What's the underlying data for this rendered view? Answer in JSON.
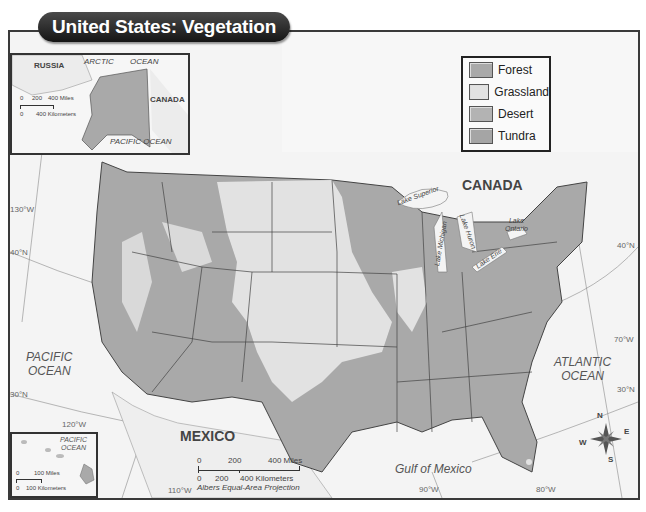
{
  "title": "United States: Vegetation",
  "legend": {
    "items": [
      {
        "label": "Forest",
        "color": "#a9a9a9"
      },
      {
        "label": "Grassland",
        "color": "#e2e2e2"
      },
      {
        "label": "Desert",
        "color": "#b3b3b3"
      },
      {
        "label": "Tundra",
        "color": "#a5a5a5"
      }
    ]
  },
  "colors": {
    "water": "#f4f4f4",
    "land_outside": "#f0f0f0",
    "forest": "#a9a9a9",
    "grassland": "#e2e2e2",
    "border": "#3a3a3a",
    "title_bg": "#1c1c1c"
  },
  "labels": {
    "countries": {
      "canada": "CANADA",
      "mexico": "MEXICO"
    },
    "oceans": {
      "pacific": [
        "PACIFIC",
        "OCEAN"
      ],
      "atlantic": [
        "ATLANTIC",
        "OCEAN"
      ],
      "gulf": "Gulf of Mexico"
    },
    "lakes": {
      "superior": "Lake Superior",
      "michigan": "Lake Michigan",
      "huron": "Lake Huron",
      "erie": "Lake Erie",
      "ontario": [
        "Lake",
        "Ontario"
      ]
    },
    "graticule": {
      "lon_130": "130°W",
      "lon_120": "120°W",
      "lon_110": "110°W",
      "lon_90": "90°W",
      "lon_80": "80°W",
      "lon_70": "70°W",
      "lat_40_west": "40°N",
      "lat_30_west": "30°N",
      "lat_40_east": "40°N",
      "lat_30_east": "30°N"
    }
  },
  "alaska_inset": {
    "russia": "RUSSIA",
    "arctic_ocean": "ARCTIC",
    "arctic_ocean_2": "OCEAN",
    "canada": "CANADA",
    "pacific_ocean": "PACIFIC OCEAN",
    "scale": {
      "miles_ticks": [
        "0",
        "200",
        "400 Miles"
      ],
      "km_ticks": [
        "0",
        "400 Kilometers"
      ]
    }
  },
  "hawaii_inset": {
    "pacific_ocean": [
      "PACIFIC",
      "OCEAN"
    ],
    "scale": {
      "miles_ticks": [
        "0",
        "100 Miles"
      ],
      "km_ticks": [
        "0",
        "100 Kilometers"
      ]
    }
  },
  "main_scale": {
    "miles_ticks": [
      "0",
      "200",
      "400 Miles"
    ],
    "km_ticks": [
      "0",
      "200",
      "400 Kilometers"
    ],
    "projection": "Albers Equal-Area Projection"
  },
  "compass": {
    "n": "N",
    "s": "S",
    "e": "E",
    "w": "W"
  }
}
